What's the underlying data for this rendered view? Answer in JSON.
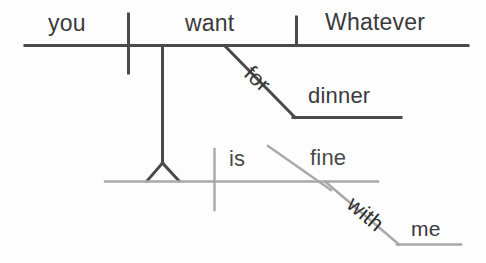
{
  "diagram": {
    "type": "reed-kellogg-sentence-diagram",
    "sentence": "Whatever you want for dinner is fine with me.",
    "colors": {
      "background": "#fdfdfd",
      "main_clause_line": "#4a4a4a",
      "subordinate_clause_line": "#a8a8a8",
      "text_dark": "#3a3a3a",
      "text_gray": "#4a4a4a"
    },
    "words": {
      "you": "you",
      "want": "want",
      "whatever": "Whatever",
      "for": "for",
      "dinner": "dinner",
      "is": "is",
      "fine": "fine",
      "with": "with",
      "me": "me"
    },
    "upper_clause": {
      "label": "noun clause: Whatever you want for dinner",
      "subject": "you",
      "verb": "want",
      "direct_object": "Whatever",
      "prepositional_phrase": {
        "preposition": "for",
        "object": "dinner"
      }
    },
    "lower_clause": {
      "label": "main clause: [noun clause] is fine with me",
      "subject_placeholder": "noun-clause-stand",
      "verb": "is",
      "predicate_adjective": "fine",
      "prepositional_phrase": {
        "preposition": "with",
        "object": "me"
      }
    }
  }
}
